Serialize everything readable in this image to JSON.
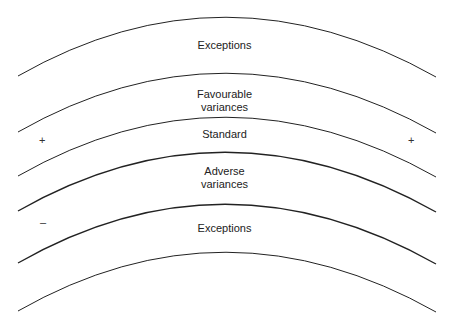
{
  "diagram": {
    "bands": [
      {
        "label_line1": "Exceptions",
        "label_line2": ""
      },
      {
        "label_line1": "Favourable",
        "label_line2": "variances"
      },
      {
        "label_line1": "Standard",
        "label_line2": ""
      },
      {
        "label_line1": "Adverse",
        "label_line2": "variances"
      },
      {
        "label_line1": "Exceptions",
        "label_line2": ""
      }
    ],
    "signs": {
      "plus": "+",
      "minus": "–"
    },
    "line_color": "#222222"
  }
}
